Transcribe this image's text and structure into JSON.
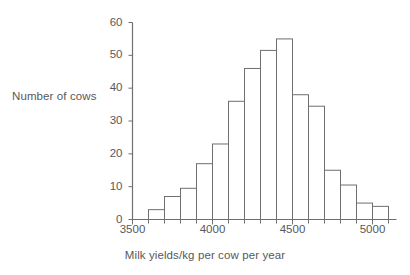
{
  "chart_data": {
    "type": "bar",
    "title": "",
    "subtitle": "",
    "xlabel": "Milk yields/kg per cow per year",
    "ylabel": "Number of cows",
    "bin_width": 100,
    "bin_edges": [
      3600,
      3700,
      3800,
      3900,
      4000,
      4100,
      4200,
      4300,
      4400,
      4500,
      4600,
      4700,
      4800,
      4900,
      5000,
      5100
    ],
    "categories": [
      "3600-3700",
      "3700-3800",
      "3800-3900",
      "3900-4000",
      "4000-4100",
      "4100-4200",
      "4200-4300",
      "4300-4400",
      "4400-4500",
      "4500-4600",
      "4600-4700",
      "4700-4800",
      "4800-4900",
      "4900-5000",
      "5000-5100"
    ],
    "values": [
      3,
      7,
      9.5,
      17,
      23,
      36,
      46,
      51.5,
      55,
      38,
      34.5,
      15,
      10.5,
      5,
      4
    ],
    "xlim": [
      3500,
      5150
    ],
    "ylim": [
      0,
      60
    ],
    "ytick_values": [
      0,
      10,
      20,
      30,
      40,
      50,
      60
    ],
    "ytick_labels": [
      "0",
      "10",
      "20",
      "30",
      "40",
      "50",
      "60"
    ],
    "xtick_major_values": [
      3500,
      4000,
      4500,
      5000
    ],
    "xtick_major_labels": [
      "3500",
      "4000",
      "4500",
      "5000"
    ],
    "xtick_minor_values": [
      3600,
      3700,
      3800,
      3900,
      4100,
      4200,
      4300,
      4400,
      4600,
      4700,
      4800,
      4900,
      5100
    ],
    "grid": false,
    "legend": false,
    "bar_fill_color": "#ffffff",
    "bar_edge_color": "#6f6f71",
    "axis_color": "#6f6f71",
    "text_color": "#58585a"
  }
}
